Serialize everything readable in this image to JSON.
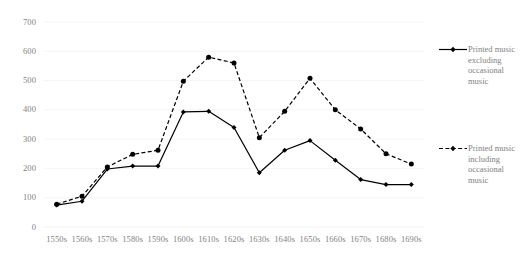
{
  "chart_data": {
    "type": "line",
    "title": "",
    "xlabel": "",
    "ylabel": "",
    "categories": [
      "1550s",
      "1560s",
      "1570s",
      "1580s",
      "1590s",
      "1600s",
      "1610s",
      "1620s",
      "1630s",
      "1640s",
      "1650s",
      "1660s",
      "1670s",
      "1680s",
      "1690s"
    ],
    "ylim": [
      0,
      700
    ],
    "yticks": [
      0,
      100,
      200,
      300,
      400,
      500,
      600,
      700
    ],
    "grid": "horizontal",
    "legend_position": "right",
    "series": [
      {
        "name": "Printed music excluding occasional music",
        "style": "solid",
        "marker": "diamond",
        "color": "#000000",
        "values": [
          75,
          88,
          198,
          208,
          208,
          393,
          395,
          340,
          185,
          262,
          295,
          228,
          162,
          145,
          145
        ]
      },
      {
        "name": "Printed music including occasional music",
        "style": "dashed",
        "marker": "circle",
        "color": "#000000",
        "values": [
          78,
          105,
          205,
          248,
          262,
          498,
          580,
          560,
          305,
          395,
          508,
          400,
          335,
          250,
          215
        ]
      }
    ]
  },
  "axis": {
    "y_labels": [
      "700",
      "600",
      "500",
      "400",
      "300",
      "200",
      "100",
      "0"
    ],
    "x_labels": [
      "1550s",
      "1560s",
      "1570s",
      "1580s",
      "1590s",
      "1600s",
      "1610s",
      "1620s",
      "1630s",
      "1640s",
      "1650s",
      "1660s",
      "1670s",
      "1680s",
      "1690s"
    ]
  },
  "legend": {
    "entries": [
      {
        "label": "Printed music excluding occasional music",
        "style": "solid"
      },
      {
        "label": "Printed music including occasional music",
        "style": "dashed"
      }
    ]
  },
  "colors": {
    "line": "#000000",
    "grid": "#f2f2f2",
    "text": "#7f7f7f"
  }
}
